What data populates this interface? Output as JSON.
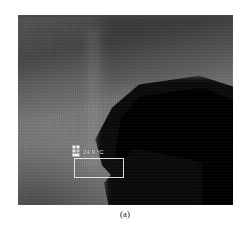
{
  "figure": {
    "caption": "(a)",
    "image_type": "infrared-thermal-image",
    "colormap": "grayscale"
  },
  "thermal_image": {
    "alt_description": "Grayscale infrared thermal image with a dark wedge-shaped region in the lower right",
    "regions": [
      {
        "name": "upper-dark-band",
        "tone": "dark-gray"
      },
      {
        "name": "central-field",
        "tone": "mid-gray"
      },
      {
        "name": "lower-right-wedge",
        "tone": "black"
      }
    ]
  },
  "measurement": {
    "marker_icon": "box-measure-icon",
    "temperature_label": "24.9 °C",
    "roi_shape": "rectangle"
  },
  "colors": {
    "page_background": "#ffffff",
    "overlay_stroke": "#ededed",
    "overlay_text": "#ededed",
    "caption_text": "#1a1a1a",
    "image_dark": "#000000",
    "image_mid": "#6f6f6f"
  }
}
